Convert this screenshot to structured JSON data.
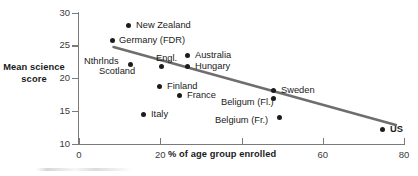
{
  "chart_data": {
    "type": "scatter",
    "title": "",
    "xlabel": "% of age group enrolled",
    "ylabel": "Mean science score",
    "xlim": [
      0,
      80
    ],
    "ylim": [
      10,
      30
    ],
    "xticks": [
      "0",
      "20",
      "40",
      "60",
      "80"
    ],
    "yticks": [
      "30",
      "25",
      "20",
      "15",
      "10"
    ],
    "grid": false,
    "legend": "none",
    "points": [
      {
        "label": "New Zealand",
        "x": 12.5,
        "y": 29.3
      },
      {
        "label": "Germany (FDR)",
        "x": 8.5,
        "y": 26.9
      },
      {
        "label": "Australia",
        "x": 27.0,
        "y": 24.6
      },
      {
        "label": "Nthrlnds",
        "x": 13.0,
        "y": 23.2
      },
      {
        "label": "Scotland",
        "x": 13.0,
        "y": 23.2
      },
      {
        "label": "Engl.",
        "x": 20.5,
        "y": 23.0
      },
      {
        "label": "Hungary",
        "x": 27.0,
        "y": 22.9
      },
      {
        "label": "Finland",
        "x": 20.0,
        "y": 20.0
      },
      {
        "label": "France",
        "x": 25.0,
        "y": 18.7
      },
      {
        "label": "Sweden",
        "x": 48.0,
        "y": 19.4
      },
      {
        "label": "Beligum (Fl.)",
        "x": 48.0,
        "y": 18.2
      },
      {
        "label": "Belgium (Fr.)",
        "x": 49.5,
        "y": 15.2
      },
      {
        "label": "Italy",
        "x": 16.0,
        "y": 15.8
      },
      {
        "label": "US",
        "x": 75.0,
        "y": 13.5
      }
    ],
    "trendline": {
      "x0": 8.5,
      "y0": 24.8,
      "x1": 78.0,
      "y1": 12.9,
      "color": "#6e6e6e"
    }
  },
  "axes": {
    "y_title": "Mean science\nscore",
    "y_title_line1": "Mean science",
    "y_title_line2": "score",
    "x_title": "% of age group enrolled",
    "y_tick_labels": [
      "30",
      "25",
      "20",
      "15",
      "10"
    ],
    "x_tick_labels": [
      "0",
      "20",
      "40",
      "60",
      "80"
    ],
    "axis_color": "#7a7a7a",
    "marker_color": "#1c1c1c"
  },
  "labels": {
    "new_zealand": "New Zealand",
    "germany": "Germany (FDR)",
    "australia": "Australia",
    "nthrlnds": "Nthrlnds",
    "scotland": "Scotland",
    "engl": "Engl.",
    "hungary": "Hungary",
    "finland": "Finland",
    "france": "France",
    "sweden": "Sweden",
    "belgium_fl": "Beligum (Fl.)",
    "belgium_fr": "Belgium (Fr.)",
    "italy": "Italy",
    "us": "US"
  }
}
